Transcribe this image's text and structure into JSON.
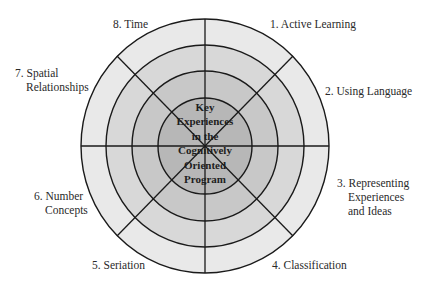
{
  "diagram": {
    "title": "Key Experiences in the Cognitively Oriented Program",
    "center_lines": [
      "Key",
      "Experiences",
      "in the",
      "Cognitively",
      "Oriented",
      "Program"
    ],
    "rings": [
      {
        "rx": 124,
        "ry": 127,
        "fill": "#e9e9e9"
      },
      {
        "rx": 99,
        "ry": 101,
        "fill": "#d8d8d8"
      },
      {
        "rx": 73,
        "ry": 75,
        "fill": "#c8c8c8"
      },
      {
        "rx": 47,
        "ry": 48,
        "fill": "#b7b7b7"
      }
    ],
    "line_color": "#1a1a1a",
    "segments": [
      {
        "number": "1",
        "line1": "1. Active Learning",
        "line2": ""
      },
      {
        "number": "2",
        "line1": "2. Using Language",
        "line2": ""
      },
      {
        "number": "3",
        "line1": "3. Representing",
        "line2": "Experiences",
        "line3": "and Ideas"
      },
      {
        "number": "4",
        "line1": "4. Classification",
        "line2": ""
      },
      {
        "number": "5",
        "line1": "5. Seriation",
        "line2": ""
      },
      {
        "number": "6",
        "line1": "6. Number",
        "line2": "Concepts"
      },
      {
        "number": "7",
        "line1": "7. Spatial",
        "line2": "Relationships"
      },
      {
        "number": "8",
        "line1": "8. Time",
        "line2": ""
      }
    ]
  }
}
